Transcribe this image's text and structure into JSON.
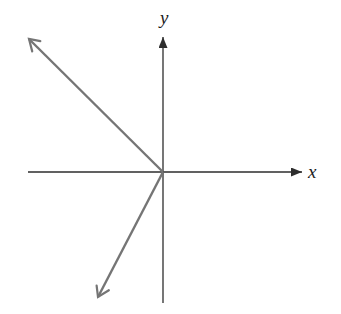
{
  "figure": {
    "type": "vector-diagram",
    "background": "#ffffff",
    "axis_color": "#2d2d2d",
    "vector_color": "#757575",
    "label_color": "#1c1c1c",
    "labels": {
      "x": "x",
      "y": "y"
    },
    "geometry": {
      "x_axis": {
        "x1": 28,
        "y1": 172,
        "x2": 302,
        "y2": 172
      },
      "y_axis": {
        "x1": 163,
        "y1": 303,
        "x2": 163,
        "y2": 37
      },
      "vector_up_left": {
        "x1": 163,
        "y1": 172,
        "x2": 29,
        "y2": 39
      },
      "vector_down_left": {
        "x1": 163,
        "y1": 172,
        "x2": 98,
        "y2": 297
      },
      "origin": {
        "x": 163,
        "y": 172
      }
    }
  }
}
